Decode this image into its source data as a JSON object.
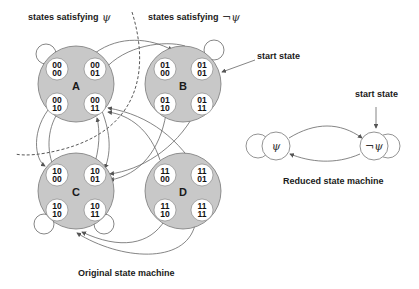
{
  "labels": {
    "psi_region": "states satisfying",
    "psi_symbol": "ψ",
    "not_psi_region": "states satisfying",
    "not_psi_symbol": "¬ψ",
    "start_state": "start state",
    "start_state_reduced": "start state",
    "original_caption": "Original state machine",
    "reduced_caption": "Reduced state machine"
  },
  "groups": [
    {
      "name": "A",
      "states": [
        [
          "00",
          "00"
        ],
        [
          "00",
          "01"
        ],
        [
          "00",
          "10"
        ],
        [
          "00",
          "11"
        ]
      ]
    },
    {
      "name": "B",
      "states": [
        [
          "01",
          "00"
        ],
        [
          "01",
          "01"
        ],
        [
          "01",
          "10"
        ],
        [
          "01",
          "11"
        ]
      ]
    },
    {
      "name": "C",
      "states": [
        [
          "10",
          "00"
        ],
        [
          "10",
          "01"
        ],
        [
          "10",
          "10"
        ],
        [
          "10",
          "11"
        ]
      ]
    },
    {
      "name": "D",
      "states": [
        [
          "11",
          "00"
        ],
        [
          "11",
          "01"
        ],
        [
          "11",
          "10"
        ],
        [
          "11",
          "11"
        ]
      ]
    }
  ],
  "reduced": {
    "psi_node": "ψ",
    "not_psi_node": "¬ψ"
  },
  "colors": {
    "group_fill": "#c8c8c8",
    "state_fill": "#ffffff",
    "edge": "#666666"
  }
}
